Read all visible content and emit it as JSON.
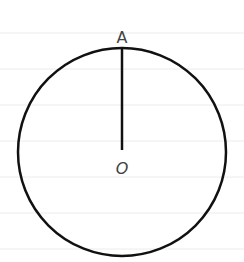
{
  "diagram": {
    "type": "geometry-circle-radius",
    "background_lines": {
      "color": "#ececec",
      "y_positions": [
        33,
        69,
        105,
        141,
        177,
        213,
        249
      ]
    },
    "circle": {
      "cx": 122,
      "cy": 152,
      "r": 104,
      "stroke": "#111111",
      "stroke_width": 2.5
    },
    "radius_segment": {
      "from_point": "A",
      "to_point": "O",
      "x": 122,
      "y1": 49,
      "y2": 150,
      "stroke": "#111111"
    },
    "points": [
      {
        "name": "A",
        "label": "A",
        "x": 122,
        "y": 42
      },
      {
        "name": "O",
        "label": "O",
        "x": 122,
        "y": 172
      }
    ]
  }
}
